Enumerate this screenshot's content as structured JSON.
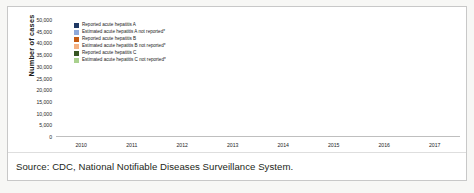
{
  "figure": {
    "caption": "Source: CDC, National Notifiable Diseases Surveillance System."
  },
  "legend": [
    {
      "label": "Reported acute hepatitis A",
      "color": "#1F3864"
    },
    {
      "label": "Estimated acute hepatitis A not reported*",
      "color": "#8EA9DB"
    },
    {
      "label": "Reported acute hepatitis B",
      "color": "#C55A11"
    },
    {
      "label": "Estimated acute hepatitis B not reported*",
      "color": "#F4B183"
    },
    {
      "label": "Reported acute hepatitis C",
      "color": "#375623"
    },
    {
      "label": "Estimated acute hepatitis C not reported*",
      "color": "#A9D18E"
    }
  ],
  "chart_data": {
    "type": "bar",
    "subtype": "grouped-stacked",
    "title": "",
    "xlabel": "",
    "ylabel": "Number of cases",
    "ylim": [
      0,
      50000
    ],
    "ytick_step": 5000,
    "yticks": [
      "0",
      "5,000",
      "10,000",
      "15,000",
      "20,000",
      "25,000",
      "30,000",
      "35,000",
      "40,000",
      "45,000",
      "50,000"
    ],
    "grid": false,
    "legend_position": "inside-top-left",
    "categories": [
      "2010",
      "2011",
      "2012",
      "2013",
      "2014",
      "2015",
      "2016",
      "2017"
    ],
    "series": [
      {
        "name": "Reported acute hepatitis A",
        "group": "A",
        "stack": "reported",
        "color": "#1F3864",
        "values": [
          1670,
          1398,
          1562,
          1781,
          1239,
          1390,
          2007,
          3366
        ]
      },
      {
        "name": "Estimated acute hepatitis A not reported*",
        "group": "A",
        "stack": "estimated",
        "color": "#8EA9DB",
        "values": [
          3330,
          2602,
          2938,
          3719,
          2761,
          2610,
          4093,
          7134
        ]
      },
      {
        "name": "Reported acute hepatitis B",
        "group": "B",
        "stack": "reported",
        "color": "#C55A11",
        "values": [
          3350,
          2890,
          2895,
          3050,
          2953,
          3370,
          3218,
          3409
        ]
      },
      {
        "name": "Estimated acute hepatitis B not reported*",
        "group": "B",
        "stack": "estimated",
        "color": "#F4B183",
        "values": [
          21650,
          18910,
          18905,
          19950,
          18047,
          22130,
          21282,
          22591
        ]
      },
      {
        "name": "Reported acute hepatitis C",
        "group": "C",
        "stack": "reported",
        "color": "#375623",
        "values": [
          850,
          1229,
          1778,
          2138,
          2194,
          2436,
          2967,
          3216
        ]
      },
      {
        "name": "Estimated acute hepatitis C not reported*",
        "group": "C",
        "stack": "estimated",
        "color": "#A9D18E",
        "values": [
          11650,
          17271,
          24722,
          29862,
          30806,
          34064,
          41533,
          45284
        ]
      }
    ],
    "group_totals": {
      "A": [
        5000,
        4000,
        4500,
        5500,
        4000,
        4000,
        6100,
        10500
      ],
      "B": [
        25000,
        21800,
        21800,
        23000,
        21000,
        25500,
        24500,
        26000
      ],
      "C": [
        12500,
        18500,
        26500,
        32000,
        33000,
        36500,
        44500,
        48500
      ]
    }
  }
}
